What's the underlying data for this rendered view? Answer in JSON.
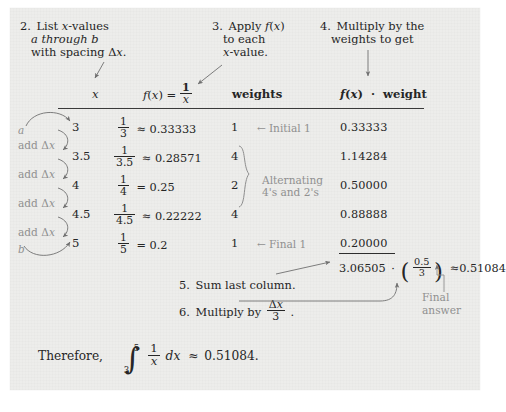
{
  "document": {
    "type": "math-worksheet-simpsons-rule",
    "background_color": "#ededeb"
  },
  "steps": {
    "step2": {
      "num": "2.",
      "line1": "List x-values",
      "line2": "a through b",
      "line3": "with spacing Δx."
    },
    "step3": {
      "num": "3.",
      "line1": "Apply  f(x)",
      "line2": "to each",
      "line3": "x-value."
    },
    "step4": {
      "num": "4.",
      "line1": "Multiply by the",
      "line2": "weights to get"
    },
    "step5": {
      "num": "5.",
      "text": "Sum last column."
    },
    "step6": {
      "num": "6.",
      "text_pre": "Multiply by",
      "fraction_num": "Δx",
      "fraction_den": "3",
      "text_post": "."
    }
  },
  "table": {
    "headers": {
      "x": "x",
      "fx_pre": "f(x) =",
      "fx_num": "1",
      "fx_den": "x",
      "weights": "weights",
      "product": "f(x)  ·  weight"
    },
    "rows": [
      {
        "x": "3",
        "frac_num": "1",
        "frac_den": "3",
        "rel": "≈",
        "fx": "0.33333",
        "weight": "1",
        "product": "0.33333"
      },
      {
        "x": "3.5",
        "frac_num": "1",
        "frac_den": "3.5",
        "rel": "≈",
        "fx": "0.28571",
        "weight": "4",
        "product": "1.14284"
      },
      {
        "x": "4",
        "frac_num": "1",
        "frac_den": "4",
        "rel": "=",
        "fx": "0.25",
        "weight": "2",
        "product": "0.50000"
      },
      {
        "x": "4.5",
        "frac_num": "1",
        "frac_den": "4.5",
        "rel": "≈",
        "fx": "0.22222",
        "weight": "4",
        "product": "0.88888"
      },
      {
        "x": "5",
        "frac_num": "1",
        "frac_den": "5",
        "rel": "=",
        "fx": "0.2",
        "weight": "1",
        "product": "0.20000"
      }
    ],
    "annotations": {
      "a_label": "a",
      "b_label": "b",
      "add_dx": "add Δx",
      "initial": "Initial 1",
      "final": "Final 1",
      "alternating_line1": "Alternating",
      "alternating_line2": "4's and 2's"
    }
  },
  "result": {
    "sum": "3.06505",
    "dot": "·",
    "paren_open": "(",
    "paren_close": ")",
    "factor_num": "0.5",
    "factor_den": "3",
    "approx": "≈",
    "value": "0.51084",
    "final_answer_line1": "Final",
    "final_answer_line2": "answer"
  },
  "conclusion": {
    "lead": "Therefore,",
    "integral_upper": "5",
    "integral_lower": "3",
    "integrand_num": "1",
    "integrand_den": "x",
    "differential": "dx",
    "approx": "≈",
    "value": "0.51084."
  }
}
